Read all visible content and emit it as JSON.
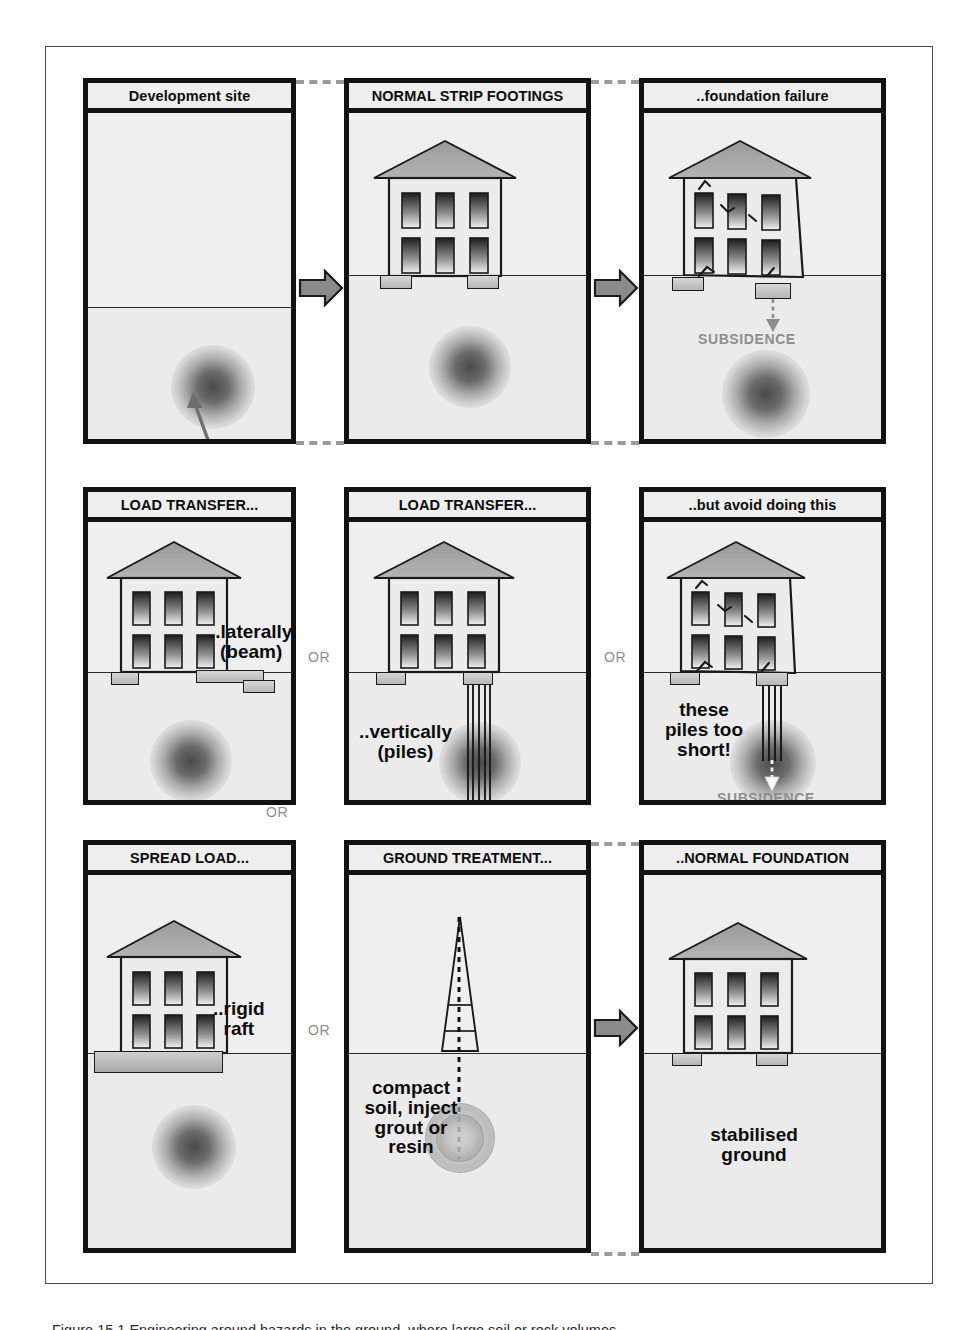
{
  "figure": {
    "caption": "Figure 15.1 Engineering around hazards in the ground, where large soil or rock volumes"
  },
  "connectors": {
    "or_label": "OR",
    "arrow_color": "#8a8a8a",
    "dashed_color": "#9a9a9a"
  },
  "common": {
    "subsidence_label": "SUBSIDENCE",
    "hazard_label": "HAZARD IN GROUND"
  },
  "panels": [
    {
      "id": "development-site",
      "title": "Development site",
      "row": 1,
      "col": 1,
      "has_house": false,
      "hazard": "dark",
      "labels": [
        {
          "name": "hazard-in-ground-label",
          "text": "HAZARD IN GROUND",
          "style": "gray",
          "size": 15
        }
      ]
    },
    {
      "id": "normal-strip-footings",
      "title": "NORMAL STRIP FOOTINGS",
      "row": 1,
      "col": 2,
      "has_house": true,
      "cracked": false,
      "foundation": "strip",
      "hazard": "dark",
      "labels": []
    },
    {
      "id": "foundation-failure",
      "title": "..foundation failure",
      "row": 1,
      "col": 3,
      "has_house": true,
      "cracked": true,
      "foundation": "strip-sunk",
      "hazard": "dark",
      "labels": [
        {
          "name": "subsidence-label",
          "text": "SUBSIDENCE",
          "style": "gray",
          "size": 14
        }
      ]
    },
    {
      "id": "load-transfer-laterally",
      "title": "LOAD TRANSFER...",
      "row": 2,
      "col": 1,
      "has_house": true,
      "cracked": false,
      "foundation": "beam",
      "hazard": "dark",
      "labels": [
        {
          "name": "laterally-beam-label",
          "text": "..laterally\n(beam)",
          "style": "black",
          "size": 19
        }
      ]
    },
    {
      "id": "load-transfer-vertically",
      "title": "LOAD TRANSFER...",
      "row": 2,
      "col": 2,
      "has_house": true,
      "cracked": false,
      "foundation": "piles-long",
      "hazard": "dark",
      "labels": [
        {
          "name": "vertically-piles-label",
          "text": "..vertically\n(piles)",
          "style": "black",
          "size": 19
        }
      ]
    },
    {
      "id": "avoid-doing-this",
      "title": "..but avoid doing this",
      "row": 2,
      "col": 3,
      "has_house": true,
      "cracked": true,
      "foundation": "piles-short",
      "hazard": "dark",
      "labels": [
        {
          "name": "piles-too-short-label",
          "text": "these\npiles too\nshort!",
          "style": "black",
          "size": 19
        },
        {
          "name": "subsidence-label",
          "text": "SUBSIDENCE",
          "style": "gray",
          "size": 14
        }
      ]
    },
    {
      "id": "spread-load",
      "title": "SPREAD LOAD...",
      "row": 3,
      "col": 1,
      "has_house": true,
      "cracked": false,
      "foundation": "raft",
      "hazard": "dark",
      "labels": [
        {
          "name": "rigid-raft-label",
          "text": "..rigid\nraft",
          "style": "black",
          "size": 19
        }
      ]
    },
    {
      "id": "ground-treatment",
      "title": "GROUND TREATMENT...",
      "row": 3,
      "col": 2,
      "has_house": false,
      "foundation": "rig",
      "hazard": "treated",
      "labels": [
        {
          "name": "compact-soil-label",
          "text": "compact\nsoil, inject\ngrout or\nresin",
          "style": "black",
          "size": 19
        }
      ]
    },
    {
      "id": "normal-foundation",
      "title": "..NORMAL FOUNDATION",
      "row": 3,
      "col": 3,
      "has_house": true,
      "cracked": false,
      "foundation": "strip",
      "hazard": "none",
      "labels": [
        {
          "name": "stabilised-ground-label",
          "text": "stabilised\nground",
          "style": "black",
          "size": 19
        }
      ]
    }
  ]
}
